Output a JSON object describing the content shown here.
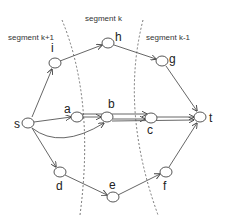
{
  "diagram": {
    "segments": [
      {
        "id": "seg-k1",
        "label": "segment k+1",
        "x": 8,
        "y": 40
      },
      {
        "id": "seg-k",
        "label": "segment k",
        "x": 85,
        "y": 21
      },
      {
        "id": "seg-km1",
        "label": "segment k-1",
        "x": 146,
        "y": 40
      }
    ],
    "nodes": [
      {
        "id": "s",
        "label": "s",
        "x": 28,
        "y": 123,
        "lx": 14,
        "ly": 128
      },
      {
        "id": "i",
        "label": "i",
        "x": 55,
        "y": 63,
        "lx": 51,
        "ly": 52
      },
      {
        "id": "h",
        "label": "h",
        "x": 108,
        "y": 43,
        "lx": 115,
        "ly": 41
      },
      {
        "id": "g",
        "label": "g",
        "x": 162,
        "y": 61,
        "lx": 169,
        "ly": 63
      },
      {
        "id": "t",
        "label": "t",
        "x": 200,
        "y": 117,
        "lx": 209,
        "ly": 122
      },
      {
        "id": "a",
        "label": "a",
        "x": 77,
        "y": 117,
        "lx": 64,
        "ly": 113
      },
      {
        "id": "b",
        "label": "b",
        "x": 107,
        "y": 117,
        "lx": 108,
        "ly": 108
      },
      {
        "id": "c",
        "label": "c",
        "x": 151,
        "y": 118,
        "lx": 147,
        "ly": 134
      },
      {
        "id": "d",
        "label": "d",
        "x": 60,
        "y": 172,
        "lx": 56,
        "ly": 190
      },
      {
        "id": "e",
        "label": "e",
        "x": 113,
        "y": 197,
        "lx": 109,
        "ly": 189
      },
      {
        "id": "f",
        "label": "f",
        "x": 166,
        "y": 172,
        "lx": 163,
        "ly": 190
      }
    ],
    "edges": [
      [
        "s",
        "i"
      ],
      [
        "i",
        "h"
      ],
      [
        "h",
        "g"
      ],
      [
        "g",
        "t"
      ],
      [
        "s",
        "a"
      ],
      [
        "a",
        "b"
      ],
      [
        "a",
        "c"
      ],
      [
        "b",
        "c"
      ],
      [
        "b",
        "t"
      ],
      [
        "c",
        "t"
      ],
      [
        "s",
        "b"
      ],
      [
        "s",
        "d"
      ],
      [
        "d",
        "e"
      ],
      [
        "e",
        "f"
      ],
      [
        "f",
        "t"
      ]
    ]
  }
}
